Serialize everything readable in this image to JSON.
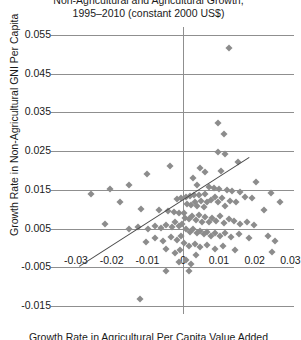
{
  "chart_data": {
    "type": "scatter",
    "title": "Non-Agricultural and Agricultural Growth,",
    "subtitle": "1995–2010 (constant 2000 US$)",
    "xlabel": "Growth Rate in Agricultural Per Capita Value Added",
    "ylabel": "Growth Rate in Non-Agricultural GNI Per Capita",
    "xlim": [
      -0.035,
      0.031
    ],
    "ylim": [
      -0.017,
      0.057
    ],
    "xticks": [
      "-0.03",
      "-0.02",
      "-0.01",
      "0",
      "0.01",
      "0.02",
      "0.03"
    ],
    "xtick_values": [
      -0.03,
      -0.02,
      -0.01,
      0,
      0.01,
      0.02,
      0.03
    ],
    "yticks": [
      "0.055",
      "0.045",
      "0.035",
      "0.025",
      "0.015",
      "0.005",
      "-0.005",
      "-0.015"
    ],
    "ytick_values": [
      0.055,
      0.045,
      0.035,
      0.025,
      0.015,
      0.005,
      -0.005,
      -0.015
    ],
    "grid": "horizontal",
    "legend": "none",
    "marker": "diamond",
    "marker_color": "#8c8c8c",
    "trendline": {
      "x0": -0.029,
      "y0": -0.0046,
      "x1": 0.0185,
      "y1": 0.0235,
      "color": "#4a4a4a"
    },
    "points": [
      [
        0.0128,
        0.0515
      ],
      [
        0.0098,
        0.0322
      ],
      [
        0.0113,
        0.0295
      ],
      [
        0.0098,
        0.0248
      ],
      [
        0.0118,
        0.0243
      ],
      [
        0.0152,
        0.0222
      ],
      [
        0.0048,
        0.0206
      ],
      [
        0.0105,
        0.02
      ],
      [
        0.006,
        0.0197
      ],
      [
        0.0203,
        0.017
      ],
      [
        0.0038,
        0.0163
      ],
      [
        0.0072,
        0.0158
      ],
      [
        0.0085,
        0.0156
      ],
      [
        0.01,
        0.0152
      ],
      [
        0.0122,
        0.015
      ],
      [
        0.0138,
        0.0146
      ],
      [
        0.016,
        0.0145
      ],
      [
        0.0245,
        0.0142
      ],
      [
        0.0062,
        0.014
      ],
      [
        0.0045,
        0.0138
      ],
      [
        0.003,
        0.0136
      ],
      [
        0.0018,
        0.0133
      ],
      [
        0.0008,
        0.0131
      ],
      [
        -0.0005,
        0.0129
      ],
      [
        -0.0018,
        0.0127
      ],
      [
        -0.0038,
        0.0212
      ],
      [
        -0.01,
        0.019
      ],
      [
        -0.0152,
        0.0163
      ],
      [
        -0.0205,
        0.0152
      ],
      [
        -0.0258,
        0.014
      ],
      [
        -0.0178,
        0.012
      ],
      [
        -0.0118,
        0.0102
      ],
      [
        -0.0068,
        0.0098
      ],
      [
        -0.0042,
        0.0096
      ],
      [
        -0.0025,
        0.0093
      ],
      [
        -0.0012,
        0.0091
      ],
      [
        0.0002,
        0.009
      ],
      [
        0.0012,
        0.0113
      ],
      [
        0.0022,
        0.011
      ],
      [
        0.0032,
        0.0118
      ],
      [
        0.004,
        0.0108
      ],
      [
        0.005,
        0.0122
      ],
      [
        0.0058,
        0.0105
      ],
      [
        0.0068,
        0.012
      ],
      [
        0.0078,
        0.0125
      ],
      [
        0.0088,
        0.0132
      ],
      [
        0.0098,
        0.0118
      ],
      [
        0.0108,
        0.0128
      ],
      [
        0.0118,
        0.0108
      ],
      [
        0.0132,
        0.0122
      ],
      [
        0.0148,
        0.0118
      ],
      [
        0.0172,
        0.0132
      ],
      [
        0.0192,
        0.0128
      ],
      [
        0.0225,
        0.0098
      ],
      [
        0.0005,
        0.0078
      ],
      [
        0.0015,
        0.0075
      ],
      [
        0.0025,
        0.0082
      ],
      [
        0.0035,
        0.0072
      ],
      [
        0.0045,
        0.0085
      ],
      [
        0.0052,
        0.0068
      ],
      [
        0.0062,
        0.008
      ],
      [
        0.0072,
        0.0066
      ],
      [
        0.0082,
        0.0078
      ],
      [
        0.0092,
        0.007
      ],
      [
        0.0102,
        0.0082
      ],
      [
        0.0115,
        0.0064
      ],
      [
        0.0128,
        0.0076
      ],
      [
        0.0142,
        0.007
      ],
      [
        0.0158,
        0.0062
      ],
      [
        0.0178,
        0.0068
      ],
      [
        0.0198,
        0.006
      ],
      [
        -0.0002,
        0.0062
      ],
      [
        -0.0012,
        0.0058
      ],
      [
        -0.0022,
        0.0066
      ],
      [
        -0.0032,
        0.0055
      ],
      [
        -0.0048,
        0.006
      ],
      [
        -0.0062,
        0.0052
      ],
      [
        -0.008,
        0.0058
      ],
      [
        -0.0098,
        0.005
      ],
      [
        -0.0125,
        0.0055
      ],
      [
        -0.0152,
        0.0048
      ],
      [
        -0.0218,
        0.0062
      ],
      [
        0.0008,
        0.0048
      ],
      [
        0.0018,
        0.0042
      ],
      [
        0.0028,
        0.005
      ],
      [
        0.0038,
        0.0038
      ],
      [
        0.0048,
        0.0045
      ],
      [
        0.0058,
        0.0035
      ],
      [
        0.0068,
        0.0042
      ],
      [
        0.0078,
        0.0032
      ],
      [
        0.009,
        0.004
      ],
      [
        0.0102,
        0.003
      ],
      [
        0.0118,
        0.0038
      ],
      [
        0.0135,
        0.0028
      ],
      [
        0.0155,
        0.0035
      ],
      [
        0.0185,
        0.0026
      ],
      [
        0.0238,
        0.0032
      ],
      [
        0.0258,
        0.0018
      ],
      [
        -0.0005,
        0.003
      ],
      [
        -0.0018,
        0.0022
      ],
      [
        -0.0035,
        0.0028
      ],
      [
        -0.0055,
        0.0018
      ],
      [
        -0.0078,
        0.0025
      ],
      [
        -0.0105,
        0.0015
      ],
      [
        0.0002,
        0.0012
      ],
      [
        0.0015,
        0.0005
      ],
      [
        0.0032,
        0.001
      ],
      [
        0.0048,
        0.0002
      ],
      [
        0.0068,
        0.0008
      ],
      [
        0.0088,
        -0.0002
      ],
      [
        0.0112,
        0.0005
      ],
      [
        0.0145,
        -0.0005
      ],
      [
        0.0248,
        -0.001
      ],
      [
        -0.0008,
        -0.0005
      ],
      [
        -0.0022,
        -0.0012
      ],
      [
        -0.0048,
        -0.0002
      ],
      [
        0.0008,
        -0.003
      ],
      [
        0.0035,
        -0.0018
      ],
      [
        0.0022,
        -0.0042
      ],
      [
        -0.0012,
        -0.0035
      ],
      [
        0.0028,
        0.018
      ],
      [
        0.0272,
        0.012
      ],
      [
        -0.0122,
        -0.0132
      ],
      [
        -0.0048,
        -0.0058
      ],
      [
        0.0016,
        -0.0058
      ]
    ]
  }
}
